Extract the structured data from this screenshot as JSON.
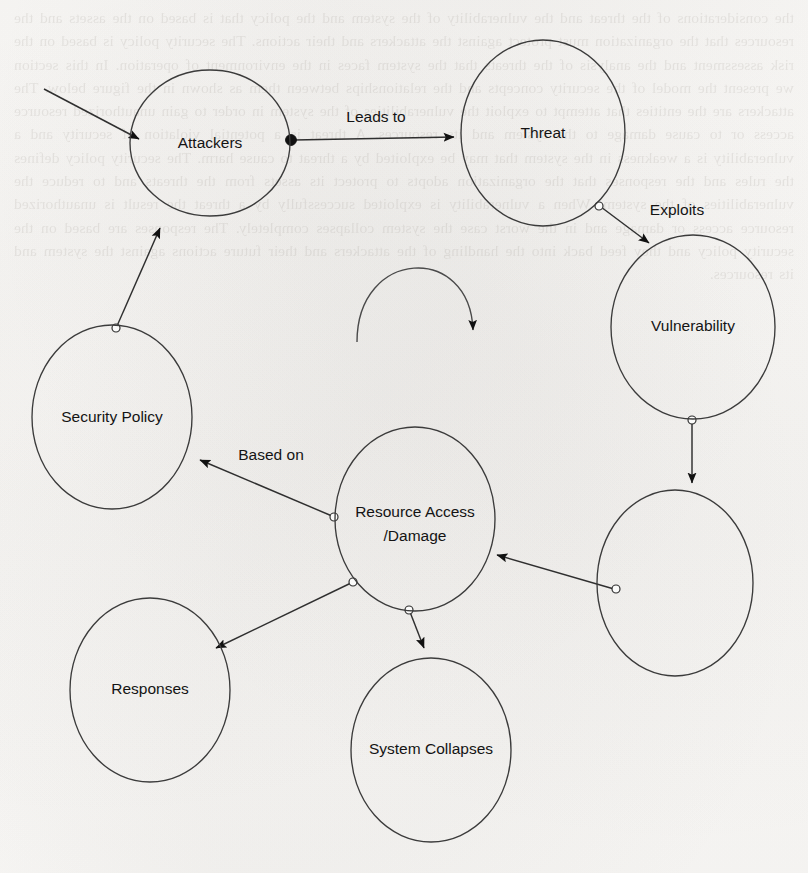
{
  "diagram": {
    "style": {
      "stroke_color": "#2f2f2f",
      "node_stroke_color": "#3b3b3b",
      "text_color": "#141414",
      "background_color": "#fbfbfa",
      "node_fill": "none"
    },
    "nodes": [
      {
        "id": "attackers",
        "label": "Attackers",
        "cx": 210,
        "cy": 143,
        "rx": 80,
        "ry": 73,
        "label_lines": [
          "Attackers"
        ]
      },
      {
        "id": "threat",
        "label": "Threat",
        "cx": 543,
        "cy": 133,
        "rx": 82,
        "ry": 93,
        "label_lines": [
          "Threat"
        ]
      },
      {
        "id": "vulnerability",
        "label": "Vulnerability",
        "cx": 693,
        "cy": 327,
        "rx": 82,
        "ry": 92,
        "label_lines": [
          "Vulnerability"
        ]
      },
      {
        "id": "unlabeled-node",
        "label": "",
        "cx": 675,
        "cy": 583,
        "rx": 78,
        "ry": 93,
        "label_lines": []
      },
      {
        "id": "security-policy",
        "label": "Security Policy",
        "cx": 112,
        "cy": 417,
        "rx": 80,
        "ry": 92,
        "label_lines": [
          "Security Policy"
        ]
      },
      {
        "id": "resource-access",
        "label": "Resource Access /Damage",
        "cx": 415,
        "cy": 519,
        "rx": 80,
        "ry": 92,
        "label_lines": [
          "Resource Access",
          "/Damage"
        ]
      },
      {
        "id": "responses",
        "label": "Responses",
        "cx": 150,
        "cy": 690,
        "rx": 80,
        "ry": 92,
        "label_lines": [
          "Responses"
        ]
      },
      {
        "id": "system-collapses",
        "label": "System Collapses",
        "cx": 431,
        "cy": 750,
        "rx": 80,
        "ry": 92,
        "label_lines": [
          "System Collapses"
        ]
      }
    ],
    "edges": [
      {
        "id": "external-to-attackers",
        "label": "",
        "from": "external",
        "to": "attackers",
        "source_marker": "none",
        "target_marker": "arrow"
      },
      {
        "id": "attackers-to-threat",
        "label": "Leads to",
        "from": "attackers",
        "to": "threat",
        "source_marker": "filled",
        "target_marker": "arrow",
        "label_x": 376,
        "label_y": 118
      },
      {
        "id": "threat-to-vulnerability",
        "label": "Exploits",
        "from": "threat",
        "to": "vulnerability",
        "source_marker": "open",
        "target_marker": "arrow",
        "label_x": 677,
        "label_y": 211
      },
      {
        "id": "vulnerability-to-unlabeled",
        "label": "",
        "from": "vulnerability",
        "to": "unlabeled-node",
        "source_marker": "open",
        "target_marker": "arrow"
      },
      {
        "id": "unlabeled-to-resource",
        "label": "",
        "from": "unlabeled-node",
        "to": "resource-access",
        "source_marker": "open",
        "target_marker": "arrow"
      },
      {
        "id": "resource-to-security-policy",
        "label": "Based on",
        "from": "resource-access",
        "to": "security-policy",
        "source_marker": "open",
        "target_marker": "arrow",
        "label_x": 271,
        "label_y": 456
      },
      {
        "id": "resource-to-responses",
        "label": "",
        "from": "resource-access",
        "to": "responses",
        "source_marker": "open",
        "target_marker": "arrow"
      },
      {
        "id": "resource-to-system-collapses",
        "label": "",
        "from": "resource-access",
        "to": "system-collapses",
        "source_marker": "open",
        "target_marker": "arrow"
      },
      {
        "id": "security-policy-to-attackers",
        "label": "",
        "from": "security-policy",
        "to": "attackers",
        "source_marker": "open",
        "target_marker": "arrow"
      },
      {
        "id": "feedback-arc",
        "label": "",
        "from": "",
        "to": "",
        "source_marker": "none",
        "target_marker": "arrow",
        "shape": "semicircular-arc"
      }
    ]
  },
  "background": {
    "kind": "scanned-page-bleedthrough",
    "ghost_text": "the considerations of the threat and the vulnerability of the system and the policy that is based on the assets and the resources that the organization must protect against the attackers and their actions. The security policy is based on the risk assessment and the analysis of the threats that the system faces in the environment of operation. In this section we present the model of the security concepts and the relationships between them as shown in the figure below. The attackers are the entities that attempt to exploit the vulnerabilities of the system in order to gain unauthorized resource access or to cause damage to the system and its resources. A threat is a potential violation of security and a vulnerability is a weakness in the system that may be exploited by a threat to cause harm. The security policy defines the rules and the responses that the organization adopts to protect its assets from the threats and to reduce the vulnerabilities of the system. When a vulnerability is exploited successfully by a threat the result is unauthorized resource access or damage and in the worst case the system collapses completely. The responses are based on the security policy and they feed back into the handling of the attackers and their future actions against the system and its resources."
  }
}
